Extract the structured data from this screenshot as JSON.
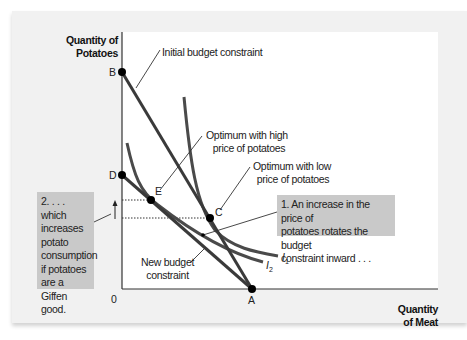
{
  "diagram": {
    "type": "indifference-curve diagram (Giffen good)",
    "axes": {
      "y_title_line1": "Quantity of",
      "y_title_line2": "Potatoes",
      "x_title_line1": "Quantity",
      "x_title_line2": "of Meat",
      "origin": "0"
    },
    "points": {
      "A": "A",
      "B": "B",
      "C": "C",
      "D": "D",
      "E": "E"
    },
    "curves": {
      "i1": {
        "letter": "I",
        "sub": "1"
      },
      "i2": {
        "letter": "I",
        "sub": "2"
      }
    },
    "labels": {
      "initial_budget": "Initial budget constraint",
      "optimum_high_line1": "Optimum with high",
      "optimum_high_line2": "price of potatoes",
      "optimum_low_line1": "Optimum with low",
      "optimum_low_line2": "price of potatoes",
      "new_budget_line1": "New budget",
      "new_budget_line2": "constraint"
    },
    "callouts": {
      "step1": [
        "1. An increase in the price of",
        "potatoes rotates the budget",
        "constraint inward . . ."
      ],
      "step2": [
        "2. . . . which",
        "increases",
        "potato",
        "consumption",
        "if potatoes",
        "are a Giffen",
        "good."
      ]
    },
    "colors": {
      "panel_bg": "#f1f1f1",
      "plot_bg": "#ffffff",
      "curve": "#3a3a3a",
      "callout_bg": "#c9c9c9",
      "point": "#000000"
    }
  }
}
